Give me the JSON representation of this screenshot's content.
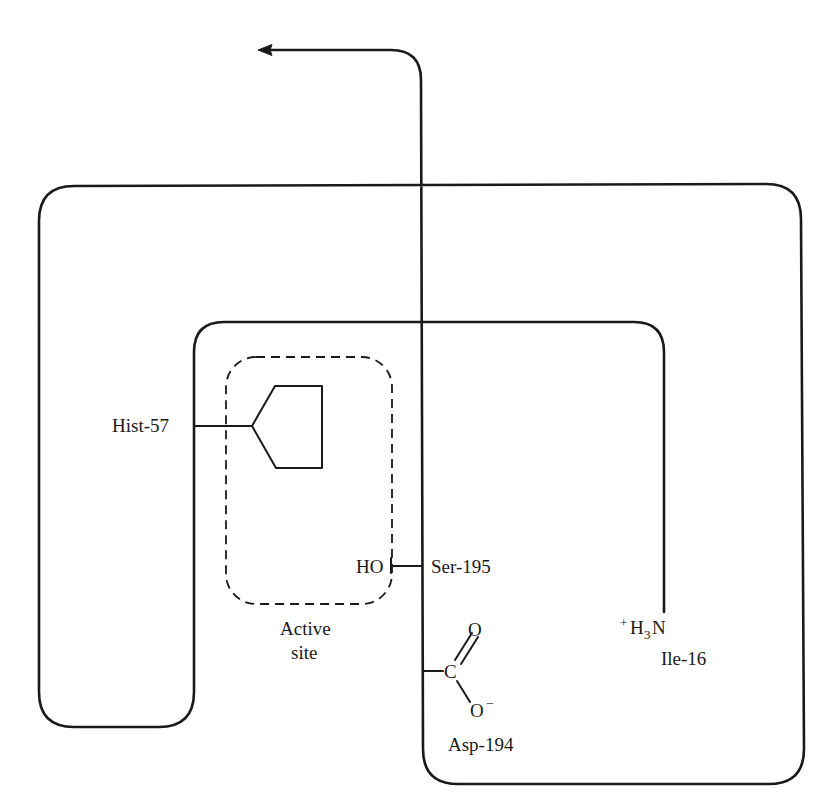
{
  "diagram": {
    "type": "protein chain fold schematic (chymotrypsin active site)",
    "labels": {
      "histidine": "Hist-57",
      "serine": "Ser-195",
      "hydroxyl": "HO",
      "active_site_line1": "Active",
      "active_site_line2": "site",
      "carbon": "C",
      "carbonyl_oxygen": "O",
      "carboxylate_oxygen": "O",
      "carboxylate_charge": "−",
      "aspartate": "Asp-194",
      "amine_charge": "+",
      "amine_H": "H",
      "amine_sub": "3",
      "amine_N": "N",
      "isoleucine": "Ile-16"
    },
    "colors": {
      "line": "#1a1a1a",
      "background": "#ffffff"
    }
  }
}
